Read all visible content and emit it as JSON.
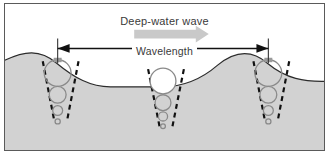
{
  "figure": {
    "title": "Deep-water wave",
    "wavelength_label": "Wavelength",
    "width": 329,
    "height": 155
  },
  "colors": {
    "frame_border": "#5a5a5a",
    "water_fill": "#d2d2d2",
    "water_surface_line": "#2b2b2b",
    "air_fill": "#ffffff",
    "orbit_circle_stroke": "#8a8a8a",
    "dashed_line": "#111111",
    "measure_arrow": "#111111",
    "direction_arrow": "#c6c6c6",
    "text": "#3a3a3a",
    "crest_marker": "#9a9a9a"
  },
  "direction_arrow": {
    "name": "wave-propagation-arrow",
    "direction": "right",
    "x_start": 134,
    "x_end": 207,
    "y": 31
  },
  "measurement": {
    "name": "wavelength-measure",
    "left_tick_x": 56,
    "right_tick_x": 268,
    "y": 47,
    "tick_top": 38,
    "tick_bottom": 64,
    "span_px": 212
  },
  "wave_surface": {
    "type": "sinusoid",
    "crest_y": 64,
    "trough_y": 88,
    "mean_y": 76,
    "crest_x_positions": [
      56,
      268
    ],
    "trough_x_positions": [
      162
    ],
    "wavelength_px": 212
  },
  "orbit_columns": [
    {
      "name": "orbit-column-left-crest",
      "position": "crest",
      "center_x": 56,
      "surface_y": 64,
      "circles": [
        {
          "cy": 70,
          "r": 13.5
        },
        {
          "cy": 92,
          "r": 8.5
        },
        {
          "cy": 108,
          "r": 5.0
        },
        {
          "cy": 119,
          "r": 2.6
        }
      ],
      "has_crest_marker": true
    },
    {
      "name": "orbit-column-middle-trough",
      "position": "trough",
      "center_x": 162,
      "surface_y": 88,
      "circles": [
        {
          "cy": 78,
          "r": 13.0
        },
        {
          "cy": 100,
          "r": 8.0
        },
        {
          "cy": 114,
          "r": 4.6
        },
        {
          "cy": 124,
          "r": 2.4
        }
      ],
      "has_crest_marker": false
    },
    {
      "name": "orbit-column-right-crest",
      "position": "crest",
      "center_x": 268,
      "surface_y": 64,
      "circles": [
        {
          "cy": 70,
          "r": 13.5
        },
        {
          "cy": 92,
          "r": 8.5
        },
        {
          "cy": 108,
          "r": 5.0
        },
        {
          "cy": 119,
          "r": 2.6
        }
      ],
      "has_crest_marker": true
    }
  ],
  "physics_note": {
    "orbit_decay": "circular orbital motion decreases in diameter with depth",
    "cone_pattern": "dashed V-shaped envelope converging downward"
  }
}
